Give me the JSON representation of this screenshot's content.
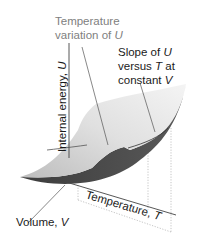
{
  "diagram": {
    "labels": {
      "temperature_variation_line1": "Temperature",
      "temperature_variation_line2_prefix": "variation of ",
      "temperature_variation_line2_var": "U",
      "slope_line1_prefix": "Slope of ",
      "slope_line1_var": "U",
      "slope_line2_prefix": "versus ",
      "slope_line2_var": "T",
      "slope_line2_suffix": " at",
      "slope_line3_prefix": "constant ",
      "slope_line3_var": "V",
      "y_axis_prefix": "Internal energy, ",
      "y_axis_var": "U",
      "x_axis_prefix": "Temperature, ",
      "x_axis_var": "T",
      "z_axis_prefix": "Volume, ",
      "z_axis_var": "V"
    },
    "colors": {
      "surface_light": "#e6e6e6",
      "surface_mid": "#c8c8c8",
      "surface_dark": "#4a4a4a",
      "callout_gray_text": "#808080",
      "text": "#1a1a1a",
      "axis": "#333333",
      "dotted": "#b0b0b0"
    }
  }
}
